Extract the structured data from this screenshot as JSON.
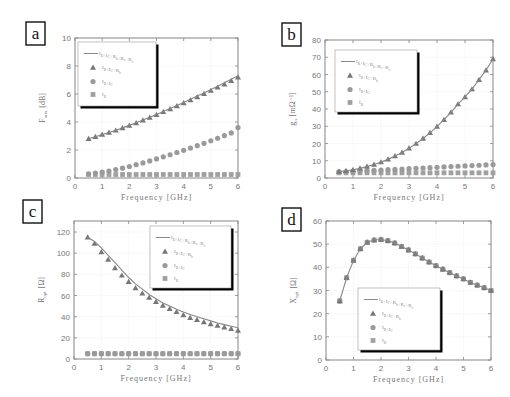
{
  "colors": {
    "series": "#8a8a8a",
    "frame": "#888888",
    "grid": "#e4e4e4",
    "legend_shadow": "#000000"
  },
  "legend_labels": [
    "I_B+I_C+R_b+R_e+R_c",
    "I_B+I_C+R_b",
    "I_B+I_C",
    "I_B"
  ],
  "chart_data": [
    {
      "panel": "a",
      "type": "scatter",
      "xlabel": "Frequency [GHz]",
      "ylabel": "F_min [dB]",
      "xlim": [
        0,
        6
      ],
      "ylim": [
        0,
        10
      ],
      "xticks": [
        0,
        1,
        2,
        3,
        4,
        5,
        6
      ],
      "yticks": [
        0,
        2,
        4,
        6,
        8,
        10
      ],
      "grid": true,
      "legend_position": "upper-left",
      "x": [
        0.5,
        0.75,
        1.0,
        1.25,
        1.5,
        1.75,
        2.0,
        2.25,
        2.5,
        2.75,
        3.0,
        3.25,
        3.5,
        3.75,
        4.0,
        4.25,
        4.5,
        4.75,
        5.0,
        5.25,
        5.5,
        5.75,
        6.0
      ],
      "series": [
        {
          "name": "I_B+I_C+R_b+R_e+R_c",
          "marker": "line",
          "values": [
            2.8,
            2.95,
            3.1,
            3.25,
            3.4,
            3.58,
            3.76,
            3.95,
            4.14,
            4.34,
            4.54,
            4.75,
            4.96,
            5.18,
            5.4,
            5.62,
            5.85,
            6.08,
            6.32,
            6.56,
            6.8,
            7.05,
            7.3
          ]
        },
        {
          "name": "I_B+I_C+R_b",
          "marker": "triangle",
          "values": [
            2.8,
            2.95,
            3.1,
            3.25,
            3.4,
            3.57,
            3.75,
            3.93,
            4.12,
            4.32,
            4.52,
            4.72,
            4.93,
            5.14,
            5.35,
            5.57,
            5.79,
            6.01,
            6.24,
            6.47,
            6.7,
            6.94,
            7.2
          ]
        },
        {
          "name": "I_B+I_C",
          "marker": "circle",
          "values": [
            0.3,
            0.35,
            0.42,
            0.5,
            0.6,
            0.7,
            0.82,
            0.95,
            1.08,
            1.22,
            1.36,
            1.51,
            1.66,
            1.82,
            1.98,
            2.14,
            2.31,
            2.48,
            2.66,
            2.84,
            3.03,
            3.22,
            3.6
          ]
        },
        {
          "name": "I_B",
          "marker": "square",
          "values": [
            0.25,
            0.25,
            0.25,
            0.25,
            0.25,
            0.25,
            0.25,
            0.25,
            0.25,
            0.25,
            0.25,
            0.25,
            0.25,
            0.25,
            0.25,
            0.25,
            0.25,
            0.25,
            0.25,
            0.25,
            0.25,
            0.25,
            0.25
          ]
        }
      ]
    },
    {
      "panel": "b",
      "type": "scatter",
      "xlabel": "Frequency [GHz]",
      "ylabel": "g_n [mΩ^-1]",
      "xlim": [
        0,
        6
      ],
      "ylim": [
        0,
        80
      ],
      "xticks": [
        0,
        1,
        2,
        3,
        4,
        5,
        6
      ],
      "yticks": [
        0,
        10,
        20,
        30,
        40,
        50,
        60,
        70,
        80
      ],
      "grid": true,
      "legend_position": "upper-left",
      "x": [
        0.5,
        0.75,
        1.0,
        1.25,
        1.5,
        1.75,
        2.0,
        2.25,
        2.5,
        2.75,
        3.0,
        3.25,
        3.5,
        3.75,
        4.0,
        4.25,
        4.5,
        4.75,
        5.0,
        5.25,
        5.5,
        5.75,
        6.0
      ],
      "series": [
        {
          "name": "I_B+I_C+R_b+R_e+R_c",
          "marker": "line",
          "values": [
            3.8,
            4.2,
            4.8,
            5.6,
            6.6,
            7.8,
            9.2,
            10.8,
            12.7,
            14.8,
            17.2,
            19.9,
            22.9,
            26.2,
            29.8,
            33.8,
            38.1,
            42.8,
            47.0,
            51.5,
            57.0,
            62.5,
            69.0
          ]
        },
        {
          "name": "I_B+I_C+R_b",
          "marker": "triangle",
          "values": [
            3.8,
            4.2,
            4.8,
            5.6,
            6.6,
            7.8,
            9.2,
            10.8,
            12.7,
            14.8,
            17.2,
            19.9,
            22.9,
            26.2,
            29.8,
            33.8,
            38.1,
            42.8,
            47.0,
            51.5,
            57.0,
            62.5,
            69.0
          ]
        },
        {
          "name": "I_B+I_C",
          "marker": "circle",
          "values": [
            3.5,
            3.6,
            3.8,
            4.0,
            4.2,
            4.4,
            4.6,
            4.8,
            5.0,
            5.2,
            5.4,
            5.6,
            5.8,
            6.0,
            6.2,
            6.4,
            6.6,
            6.8,
            7.0,
            7.2,
            7.4,
            7.6,
            7.8
          ]
        },
        {
          "name": "I_B",
          "marker": "square",
          "values": [
            3.0,
            3.0,
            3.0,
            3.0,
            3.0,
            3.0,
            3.0,
            3.0,
            3.0,
            3.0,
            3.0,
            3.0,
            3.0,
            3.0,
            3.0,
            3.0,
            3.0,
            3.0,
            3.0,
            3.0,
            3.0,
            3.0,
            3.0
          ]
        }
      ]
    },
    {
      "panel": "c",
      "type": "scatter",
      "xlabel": "Frequency [GHz]",
      "ylabel": "R_opt [Ω]",
      "xlim": [
        0,
        6
      ],
      "ylim": [
        0,
        120
      ],
      "xticks": [
        0,
        1,
        2,
        3,
        4,
        5,
        6
      ],
      "yticks": [
        0,
        20,
        40,
        60,
        80,
        100,
        120
      ],
      "grid": true,
      "legend_position": "upper-right",
      "x": [
        0.5,
        0.75,
        1.0,
        1.25,
        1.5,
        1.75,
        2.0,
        2.25,
        2.5,
        2.75,
        3.0,
        3.25,
        3.5,
        3.75,
        4.0,
        4.25,
        4.5,
        4.75,
        5.0,
        5.25,
        5.5,
        5.75,
        6.0
      ],
      "series": [
        {
          "name": "I_B+I_C+R_b+R_e+R_c",
          "marker": "line",
          "values": [
            115,
            111,
            105,
            98,
            91,
            84,
            77,
            71,
            66,
            61,
            57,
            53,
            50,
            47,
            44.5,
            42,
            40,
            38,
            36,
            34,
            32.5,
            31,
            29.5
          ]
        },
        {
          "name": "I_B+I_C+R_b",
          "marker": "triangle",
          "values": [
            115,
            109,
            101,
            94,
            86,
            79,
            73,
            67,
            62,
            58,
            54,
            50.5,
            47.5,
            44.5,
            41.5,
            39,
            37,
            35,
            33,
            31.5,
            30,
            28.5,
            27
          ]
        },
        {
          "name": "I_B+I_C",
          "marker": "circle",
          "values": [
            5,
            5,
            5,
            5,
            5,
            5,
            5,
            5,
            5,
            5,
            5,
            5,
            5,
            5,
            5,
            5,
            5,
            5,
            5,
            5,
            5,
            5,
            5
          ]
        },
        {
          "name": "I_B",
          "marker": "square",
          "values": [
            5,
            5,
            5,
            5,
            5,
            5,
            5,
            5,
            5,
            5,
            5,
            5,
            5,
            5,
            5,
            5,
            5,
            5,
            5,
            5,
            5,
            5,
            5
          ]
        }
      ]
    },
    {
      "panel": "d",
      "type": "scatter",
      "xlabel": "Frequency [GHz]",
      "ylabel": "X_opt [Ω]",
      "xlim": [
        0,
        6
      ],
      "ylim": [
        0,
        60
      ],
      "xticks": [
        0,
        1,
        2,
        3,
        4,
        5,
        6
      ],
      "yticks": [
        0,
        10,
        20,
        30,
        40,
        50,
        60
      ],
      "grid": true,
      "legend_position": "lower-center",
      "x": [
        0.5,
        0.75,
        1.0,
        1.25,
        1.5,
        1.75,
        2.0,
        2.25,
        2.5,
        2.75,
        3.0,
        3.25,
        3.5,
        3.75,
        4.0,
        4.25,
        4.5,
        4.75,
        5.0,
        5.25,
        5.5,
        5.75,
        6.0
      ],
      "series": [
        {
          "name": "I_B+I_C+R_b+R_e+R_c",
          "marker": "line",
          "values": [
            25.5,
            35.5,
            43,
            48,
            50.8,
            51.8,
            52,
            51.5,
            50.5,
            49,
            47.5,
            45.8,
            44,
            42.3,
            40.7,
            39.2,
            37.7,
            36.3,
            35,
            33.5,
            32.3,
            31.2,
            30
          ]
        },
        {
          "name": "I_B+I_C+R_b",
          "marker": "triangle",
          "values": [
            25.5,
            35.5,
            43,
            48,
            50.8,
            51.8,
            52,
            51.5,
            50.5,
            49,
            47.5,
            45.8,
            44,
            42.3,
            40.7,
            39.2,
            37.7,
            36.3,
            35,
            33.5,
            32.3,
            31.2,
            30
          ]
        },
        {
          "name": "I_B+I_C",
          "marker": "circle",
          "values": [
            25.5,
            35.5,
            43,
            48,
            50.8,
            51.8,
            52,
            51.5,
            50.5,
            49,
            47.5,
            45.8,
            44,
            42.3,
            40.7,
            39.2,
            37.7,
            36.3,
            35,
            33.5,
            32.3,
            31.2,
            30
          ]
        },
        {
          "name": "I_B",
          "marker": "square",
          "values": [
            25.5,
            35.5,
            43,
            48,
            50.8,
            51.8,
            52,
            51.5,
            50.5,
            49,
            47.5,
            45.8,
            44,
            42.3,
            40.7,
            39.2,
            37.7,
            36.3,
            35,
            33.5,
            32.3,
            31.2,
            30
          ]
        }
      ]
    }
  ],
  "panels": {
    "a": {
      "letter": "a",
      "ylabel_main": "F",
      "ylabel_sub": "min",
      "ylabel_unit": "[dB]",
      "xlabel": "Frequency [GHz]"
    },
    "b": {
      "letter": "b",
      "ylabel_main": "g",
      "ylabel_sub": "n",
      "ylabel_unit": "[mΩ⁻¹]",
      "xlabel": "Frequency [GHz]"
    },
    "c": {
      "letter": "c",
      "ylabel_main": "R",
      "ylabel_sub": "opt",
      "ylabel_unit": "[Ω]",
      "xlabel": "Frequency [GHz]"
    },
    "d": {
      "letter": "d",
      "ylabel_main": "X",
      "ylabel_sub": "opt",
      "ylabel_unit": "[Ω]",
      "xlabel": "Frequency [GHz]"
    }
  }
}
